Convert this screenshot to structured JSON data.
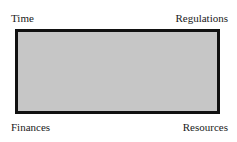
{
  "diagram": {
    "box_fill": "#c6c6c6",
    "box_border": "#111111",
    "labels": {
      "top_left": "Time",
      "top_right": "Regulations",
      "bottom_left": "Finances",
      "bottom_right": "Resources"
    }
  }
}
